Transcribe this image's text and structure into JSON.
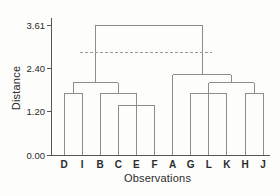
{
  "chart_data": {
    "type": "dendrogram",
    "title": "",
    "xlabel": "Observations",
    "ylabel": "Distance",
    "leaves": [
      "D",
      "I",
      "B",
      "C",
      "E",
      "F",
      "A",
      "G",
      "L",
      "K",
      "H",
      "J"
    ],
    "yticks": [
      {
        "label": "0.00",
        "value": 0.0
      },
      {
        "label": "1.20",
        "value": 1.2
      },
      {
        "label": "2.40",
        "value": 2.4
      },
      {
        "label": "3.61",
        "value": 3.61
      }
    ],
    "ylim": [
      0,
      3.61
    ],
    "grid": false,
    "legend": null,
    "cutoff_line": {
      "style": "dashed",
      "value": 2.85
    },
    "tree": {
      "h": 3.61,
      "children": [
        {
          "h": 2.01,
          "children": [
            {
              "h": 1.71,
              "children": [
                {
                  "leaf": "D"
                },
                {
                  "leaf": "I"
                }
              ]
            },
            {
              "h": 1.71,
              "children": [
                {
                  "leaf": "B"
                },
                {
                  "h": 1.38,
                  "children": [
                    {
                      "leaf": "C"
                    },
                    {
                      "leaf": "E"
                    },
                    {
                      "leaf": "F"
                    }
                  ]
                }
              ]
            }
          ]
        },
        {
          "h": 2.23,
          "children": [
            {
              "leaf": "A"
            },
            {
              "h": 2.01,
              "children": [
                {
                  "h": 1.71,
                  "children": [
                    {
                      "leaf": "G"
                    },
                    {
                      "leaf": "L"
                    },
                    {
                      "leaf": "K"
                    }
                  ]
                },
                {
                  "h": 1.71,
                  "children": [
                    {
                      "leaf": "H"
                    },
                    {
                      "leaf": "J"
                    }
                  ]
                }
              ]
            }
          ]
        }
      ]
    },
    "colors": {
      "line": "#8c8c8c",
      "dashed_line": "#9a9a9a",
      "axis": "#555555",
      "text": "#2b2b2b",
      "background": "#fdfdfc"
    }
  }
}
